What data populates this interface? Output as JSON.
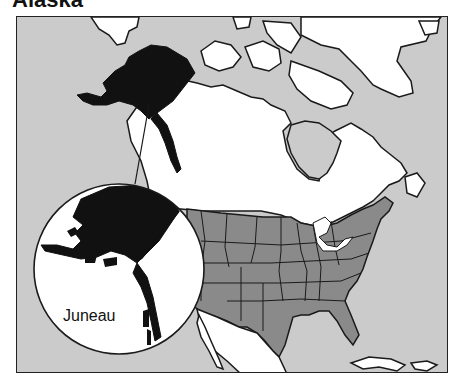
{
  "title": "Alaska",
  "map": {
    "inset_label": "Juneau",
    "colors": {
      "ocean": "#cbcbcb",
      "land": "#ffffff",
      "alaska": "#111111",
      "usa": "#8a8a8a",
      "outline": "#1a1a1a"
    },
    "regions": [
      "Alaska",
      "Canada",
      "Greenland",
      "Contiguous United States",
      "Mexico",
      "Cuba",
      "Hispaniola"
    ]
  }
}
